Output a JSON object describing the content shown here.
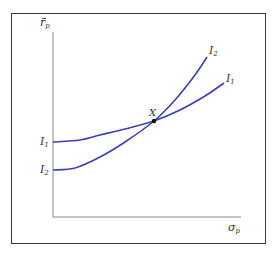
{
  "chart_data": {
    "type": "line",
    "title": "",
    "xlabel": "σp",
    "ylabel": "r̄p",
    "grid": false,
    "legend": "inline labels at curve ends",
    "series": [
      {
        "name": "I1",
        "label_left": "I1",
        "label_right": "I1",
        "color": "#3b41b3",
        "points": [
          [
            53,
            142
          ],
          [
            80,
            140
          ],
          [
            100,
            135
          ],
          [
            125,
            129
          ],
          [
            154,
            121
          ],
          [
            180,
            110
          ],
          [
            205,
            96
          ],
          [
            224,
            83
          ]
        ]
      },
      {
        "name": "I2",
        "label_left": "I2",
        "label_right": "I2",
        "color": "#3b41b3",
        "points": [
          [
            53,
            170
          ],
          [
            75,
            168
          ],
          [
            100,
            157
          ],
          [
            125,
            142
          ],
          [
            154,
            121
          ],
          [
            175,
            100
          ],
          [
            195,
            75
          ],
          [
            207,
            57
          ]
        ]
      }
    ],
    "annotations": [
      {
        "text": "X",
        "x": 154,
        "y": 121,
        "note": "tangency/intersection point of I1 and I2"
      }
    ],
    "axis_color": "#8a8a8a",
    "frame_color": "#3a3a3a"
  },
  "labels": {
    "y_axis_main": "r̄",
    "y_axis_sub": "p",
    "x_axis_main": "σ",
    "x_axis_sub": "p",
    "point_x": "X",
    "i1_left_main": "I",
    "i1_left_sub": "1",
    "i2_left_main": "I",
    "i2_left_sub": "2",
    "i1_right_main": "I",
    "i1_right_sub": "1",
    "i2_right_main": "I",
    "i2_right_sub": "2"
  }
}
